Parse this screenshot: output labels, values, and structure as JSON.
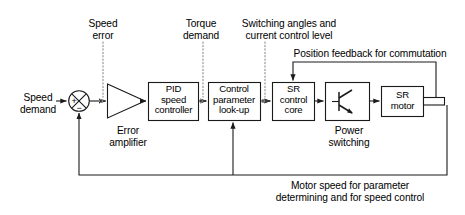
{
  "diagram": {
    "colors": {
      "line": "#1a1a1a",
      "dotted": "#8c8c8c",
      "background": "#ffffff",
      "text": "#000000"
    },
    "blocks": [
      {
        "id": "pid",
        "label": "PID\nspeed\ncontroller",
        "x": 148,
        "y": 82,
        "w": 50,
        "h": 38
      },
      {
        "id": "lookup",
        "label": "Control\nparameter\nlook-up",
        "x": 208,
        "y": 82,
        "w": 52,
        "h": 38
      },
      {
        "id": "sr-core",
        "label": "SR\ncontrol\ncore",
        "x": 272,
        "y": 82,
        "w": 42,
        "h": 38
      },
      {
        "id": "power-switching",
        "label": "",
        "x": 325,
        "y": 82,
        "w": 44,
        "h": 38
      },
      {
        "id": "sr-motor",
        "label": "SR\nmotor",
        "x": 381,
        "y": 86,
        "w": 42,
        "h": 30
      }
    ],
    "shapes": {
      "summing_junction": {
        "id": "summing-junction",
        "cx": 79,
        "cy": 101,
        "r": 10.5
      },
      "summing_plus": "+",
      "summing_minus": "−",
      "amplifier": {
        "id": "error-amplifier-triangle",
        "x": 107,
        "y": 84,
        "w": 38,
        "h": 34
      },
      "motor_shaft": {
        "x": 423,
        "y": 97,
        "w": 22,
        "h": 8
      }
    },
    "external_labels": [
      {
        "id": "speed-demand",
        "text": "Speed\ndemand",
        "x": 12,
        "y": 92,
        "w": 52,
        "align": "center"
      },
      {
        "id": "speed-error",
        "text": "Speed\nerror",
        "x": 72,
        "y": 18,
        "w": 62,
        "align": "center"
      },
      {
        "id": "torque-demand",
        "text": "Torque\ndemand",
        "x": 170,
        "y": 18,
        "w": 62,
        "align": "center"
      },
      {
        "id": "switching-angles",
        "text": "Switching angles and\ncurrent control level",
        "x": 228,
        "y": 18,
        "w": 122,
        "align": "center"
      },
      {
        "id": "position-feedback",
        "text": "Position feedback for commutation",
        "x": 284,
        "y": 48,
        "w": 172,
        "align": "center"
      },
      {
        "id": "error-amplifier",
        "text": "Error\namplifier",
        "x": 98,
        "y": 125,
        "w": 60,
        "align": "center"
      },
      {
        "id": "power-switching-label",
        "text": "Power\nswitching",
        "x": 318,
        "y": 125,
        "w": 62,
        "align": "center"
      },
      {
        "id": "motor-speed-feedback",
        "text": "Motor speed for parameter\ndetermining and for speed control",
        "x": 250,
        "y": 180,
        "w": 200,
        "align": "center"
      }
    ],
    "signal_flow": [
      "Speed demand → summing junction (+)",
      "Summing junction → Error amplifier",
      "Error amplifier → PID speed controller",
      "PID speed controller → Control parameter look-up",
      "Control parameter look-up → SR control core",
      "SR control core → Power switching",
      "Power switching → SR motor",
      "SR motor shaft → Position feedback for commutation → SR control core",
      "SR motor shaft → Motor speed → Control parameter look-up",
      "SR motor shaft → Motor speed → summing junction (−)"
    ]
  }
}
